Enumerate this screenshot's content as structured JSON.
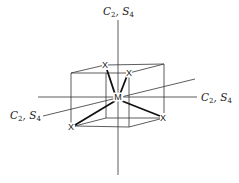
{
  "diagram": {
    "title": "",
    "axis_labels": {
      "vertical": {
        "symbol1": "C",
        "sub1": "2",
        "symbol2": "S",
        "sub2": "4"
      },
      "horizontal": {
        "symbol1": "C",
        "sub1": "2",
        "symbol2": "S",
        "sub2": "4"
      },
      "depth": {
        "symbol1": "C",
        "sub1": "2",
        "symbol2": "S",
        "sub2": "4"
      }
    },
    "center_atom": "M",
    "ligand_atoms": [
      "X",
      "X",
      "X",
      "X"
    ],
    "colors": {
      "line": "#333333",
      "bond": "#111111",
      "text": "#222222"
    }
  }
}
